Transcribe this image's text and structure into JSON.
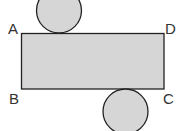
{
  "diagram": {
    "labels": {
      "a": "A",
      "b": "B",
      "c": "C",
      "d": "D"
    },
    "colors": {
      "fill": "#d6d6d6",
      "stroke": "#222222"
    }
  }
}
